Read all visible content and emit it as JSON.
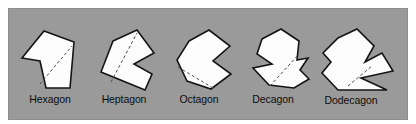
{
  "figure": {
    "background_color": "#ffffff",
    "panel_color": "#9a9a9a",
    "shape_fill": "#fdfdfd",
    "shape_stroke": "#141414",
    "diagonal_color": "#4d4d4d",
    "label_color": "#0d0d0d",
    "shapes": [
      {
        "id": "hexagon",
        "label": "Hexagon",
        "sides": 6,
        "label_x": 50,
        "label_y": 103,
        "outline": "44,31 74,42 70,88 46,88 40,61 22,58",
        "diagonal": "40,84 72,46"
      },
      {
        "id": "heptagon",
        "label": "Heptagon",
        "sides": 7,
        "label_x": 124,
        "label_y": 103,
        "outline": "113,41 137,30 154,53 134,64 152,74 145,90 101,72",
        "diagonal": "111,82 137,33"
      },
      {
        "id": "octagon",
        "label": "Octagon",
        "sides": 8,
        "label_x": 199,
        "label_y": 103,
        "outline": "189,41 209,30 230,46 213,61 231,74 211,89 187,81 177,60",
        "diagonal": "178,67 213,88"
      },
      {
        "id": "decagon",
        "label": "Decagon",
        "sides": 10,
        "label_x": 273,
        "label_y": 103,
        "outline": "262,39 281,29 299,41 297,60 308,58 300,70 309,79 294,88 269,85 253,68 272,64 257,54"
      },
      {
        "id": "dodecagon",
        "label": "Dodecagon",
        "sides": 12,
        "label_x": 351,
        "label_y": 104,
        "outline": "338,38 357,29 374,46 365,62 382,53 393,71 361,78 387,90 338,90 322,73 331,62 323,53"
      }
    ],
    "extra_diagonals": [
      {
        "id": "decagon-diagonal",
        "path": "270,86 299,54"
      },
      {
        "id": "dodecagon-diagonal",
        "path": "348,86 372,66"
      }
    ]
  }
}
